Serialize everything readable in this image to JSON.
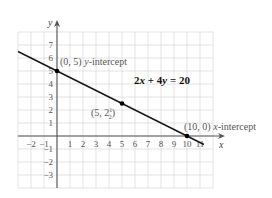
{
  "chart_data": {
    "type": "line",
    "title": "",
    "equation": "2x + 4y = 20",
    "xlabel": "x",
    "ylabel": "y",
    "xlim": [
      -3,
      12
    ],
    "ylim": [
      -4,
      8
    ],
    "grid": true,
    "x_ticks": [
      "−2",
      "−1",
      "1",
      "2",
      "3",
      "4",
      "5",
      "6",
      "7",
      "8",
      "9",
      "10",
      "11"
    ],
    "y_ticks": [
      "7",
      "6",
      "5",
      "4",
      "3",
      "2",
      "1",
      "−1",
      "−2",
      "−3"
    ],
    "series": [
      {
        "name": "2x + 4y = 20",
        "x": [
          -3,
          0,
          5,
          10,
          11.3
        ],
        "y": [
          6.5,
          5,
          2.5,
          0,
          -0.65
        ]
      }
    ],
    "points": [
      {
        "x": 0,
        "y": 5,
        "label": "(0, 5)",
        "note": "y-intercept"
      },
      {
        "x": 5,
        "y": 2.5,
        "label": "(5, 2",
        "frac_num": "1",
        "frac_den": "2",
        "label_end": ")"
      },
      {
        "x": 10,
        "y": 0,
        "label": "(10, 0)",
        "note": "x-intercept"
      }
    ],
    "colors": {
      "line": "#1a1a1a",
      "grid": "#dcdcdc",
      "axis": "#555555",
      "point": "#000000"
    }
  }
}
